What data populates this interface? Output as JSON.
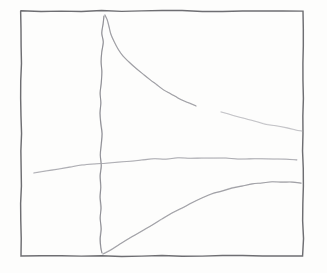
{
  "image": {
    "kind": "hand-drawn-pencil-sketch",
    "medium_note": "pencil on paper",
    "width": 327,
    "height": 273,
    "background_color": "#fdfdfc",
    "title": "",
    "subtitle": "",
    "visible_text": []
  },
  "frame": {
    "name": "plot-frame",
    "color": "#6e6e72",
    "stroke_width": 1.45,
    "left": 21,
    "top": 11,
    "right": 303,
    "bottom": 256
  },
  "chart_data": {
    "type": "line",
    "title": "",
    "subtitle": "",
    "xlabel": "",
    "ylabel": "",
    "xlim": [
      21,
      303
    ],
    "ylim": [
      256,
      11
    ],
    "grid": false,
    "legend": null,
    "axis_tick_labels": {
      "x": [],
      "y": []
    },
    "annotations": [],
    "series": [
      {
        "name": "vertical-asymptote-line",
        "color": "#8d8d93",
        "stroke_width": 1.15,
        "opacity": 0.95,
        "points": [
          [
            104,
            16
          ],
          [
            103,
            24
          ],
          [
            102,
            33
          ],
          [
            103,
            42
          ],
          [
            102,
            52
          ],
          [
            101,
            62
          ],
          [
            102,
            72
          ],
          [
            101,
            83
          ],
          [
            100,
            93
          ],
          [
            101,
            103
          ],
          [
            100,
            113
          ],
          [
            101,
            124
          ],
          [
            102,
            134
          ],
          [
            101,
            145
          ],
          [
            100,
            155
          ],
          [
            101,
            166
          ],
          [
            100,
            176
          ],
          [
            101,
            187
          ],
          [
            100,
            197
          ],
          [
            101,
            208
          ],
          [
            100,
            218
          ],
          [
            101,
            229
          ],
          [
            100,
            239
          ],
          [
            101,
            248
          ],
          [
            102,
            253
          ]
        ]
      },
      {
        "name": "descending-curve",
        "color": "#9a9aa0",
        "stroke_width": 1.15,
        "opacity": 0.92,
        "points": [
          [
            105,
            15
          ],
          [
            107,
            20
          ],
          [
            109,
            27
          ],
          [
            111,
            34
          ],
          [
            114,
            42
          ],
          [
            118,
            49
          ],
          [
            123,
            56
          ],
          [
            129,
            62
          ],
          [
            136,
            68
          ],
          [
            143,
            74
          ],
          [
            150,
            80
          ],
          [
            157,
            85
          ],
          [
            164,
            90
          ],
          [
            171,
            94
          ],
          [
            178,
            98
          ],
          [
            185,
            101
          ],
          [
            191,
            104
          ],
          [
            196,
            106
          ]
        ]
      },
      {
        "name": "descending-curve-tail-segment",
        "color": "#b4b4ba",
        "stroke_width": 1.05,
        "opacity": 0.75,
        "points": [
          [
            221,
            112
          ],
          [
            232,
            115
          ],
          [
            243,
            118
          ],
          [
            254,
            121
          ],
          [
            265,
            124
          ],
          [
            276,
            126
          ],
          [
            287,
            128
          ],
          [
            296,
            130
          ],
          [
            302,
            131
          ]
        ]
      },
      {
        "name": "near-horizontal-line",
        "color": "#a2a2a8",
        "stroke_width": 1.05,
        "opacity": 0.85,
        "points": [
          [
            34,
            173
          ],
          [
            46,
            171
          ],
          [
            58,
            169
          ],
          [
            70,
            167
          ],
          [
            82,
            165
          ],
          [
            94,
            164
          ],
          [
            106,
            163
          ],
          [
            118,
            162
          ],
          [
            130,
            161
          ],
          [
            142,
            160
          ],
          [
            154,
            159
          ],
          [
            166,
            159
          ],
          [
            178,
            158
          ],
          [
            190,
            158
          ],
          [
            202,
            158
          ],
          [
            214,
            158
          ],
          [
            226,
            158
          ],
          [
            238,
            159
          ],
          [
            250,
            159
          ],
          [
            262,
            159
          ],
          [
            274,
            159
          ],
          [
            286,
            159
          ],
          [
            297,
            160
          ]
        ]
      },
      {
        "name": "rising-curve",
        "color": "#9a9aa0",
        "stroke_width": 1.15,
        "opacity": 0.9,
        "points": [
          [
            103,
            254
          ],
          [
            112,
            249
          ],
          [
            122,
            243
          ],
          [
            132,
            237
          ],
          [
            142,
            231
          ],
          [
            152,
            225
          ],
          [
            162,
            219
          ],
          [
            172,
            213
          ],
          [
            182,
            208
          ],
          [
            192,
            203
          ],
          [
            202,
            198
          ],
          [
            212,
            194
          ],
          [
            222,
            191
          ],
          [
            232,
            188
          ],
          [
            242,
            186
          ],
          [
            252,
            184
          ],
          [
            262,
            183
          ],
          [
            272,
            182
          ],
          [
            282,
            182
          ],
          [
            292,
            182
          ],
          [
            301,
            183
          ]
        ]
      }
    ]
  }
}
